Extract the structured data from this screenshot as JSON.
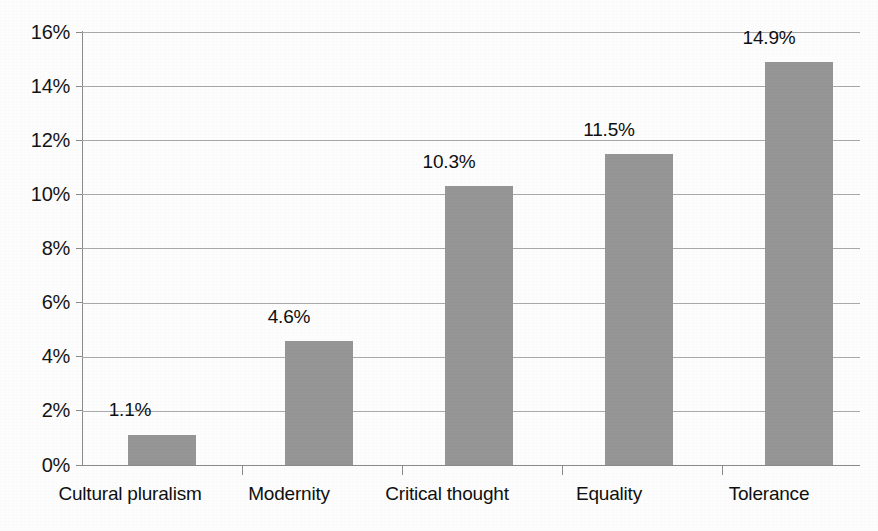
{
  "chart_data": {
    "type": "bar",
    "title": "",
    "subtitle": "",
    "xlabel": "",
    "ylabel": "",
    "categories": [
      "Cultural pluralism",
      "Modernity",
      "Critical thought",
      "Equality",
      "Tolerance"
    ],
    "values": [
      1.1,
      4.6,
      10.3,
      11.5,
      14.9
    ],
    "data_labels": [
      "1.1%",
      "4.6%",
      "10.3%",
      "11.5%",
      "14.9%"
    ],
    "ylim": [
      0,
      16
    ],
    "ytick_values": [
      16,
      14,
      12,
      10,
      8,
      6,
      4,
      2,
      0
    ],
    "ytick_labels": [
      "16%",
      "14%",
      "12%",
      "10%",
      "8%",
      "6%",
      "4%",
      "2%",
      "0%"
    ],
    "grid": true,
    "grid_axis": "y",
    "legend": false,
    "legend_position": "none",
    "bar_color": "#969696",
    "gridline_color": "#a9a9a9",
    "axis_color": "#8a8a8a",
    "background_color": "#fdfdfd",
    "text_color": "#101010",
    "units": "percent",
    "series": [
      {
        "name": "",
        "values": [
          1.1,
          4.6,
          10.3,
          11.5,
          14.9
        ]
      }
    ]
  }
}
